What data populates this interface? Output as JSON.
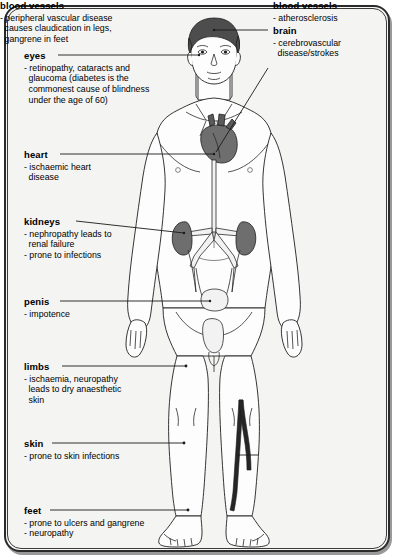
{
  "diagram": {
    "frame_color": "#2b2b2b",
    "background_color": "#f4f4f2",
    "leader_line_color": "#1a1a1a",
    "organ_fill_color": "#6e6e6e",
    "hair_fill_color": "#4a4a4a",
    "vessel_fill_color": "#262626",
    "skin_fill_color": "#fdfdfd"
  },
  "annotations": {
    "eyes": {
      "heading": "eyes",
      "lines": [
        "- retinopathy, cataracts and",
        "glaucoma (diabetes is the",
        "commonest cause of blindness",
        "under the age of 60)"
      ]
    },
    "heart": {
      "heading": "heart",
      "lines": [
        "- ischaemic heart",
        "disease"
      ]
    },
    "kidneys": {
      "heading": "kidneys",
      "lines": [
        "- nephropathy leads to",
        "renal failure",
        "- prone to infections"
      ]
    },
    "penis": {
      "heading": "penis",
      "lines": [
        "- impotence"
      ]
    },
    "limbs": {
      "heading": "limbs",
      "lines": [
        "- ischaemia, neuropathy",
        "leads to dry anaesthetic",
        "skin"
      ]
    },
    "skin": {
      "heading": "skin",
      "lines": [
        "- prone to skin infections"
      ]
    },
    "feet": {
      "heading": "feet",
      "lines": [
        "- prone to ulcers and gangrene",
        "- neuropathy"
      ]
    },
    "brain": {
      "heading": "brain",
      "lines": [
        "- cerebrovascular",
        "disease/strokes"
      ]
    },
    "blood_vessels_upper": {
      "heading": "blood vessels",
      "lines": [
        "- atherosclerosis"
      ]
    },
    "blood_vessels_lower": {
      "heading": "blood vessels",
      "lines": [
        "- peripheral vascular disease",
        "causes claudication in legs,",
        "gangrene in feet"
      ]
    }
  }
}
